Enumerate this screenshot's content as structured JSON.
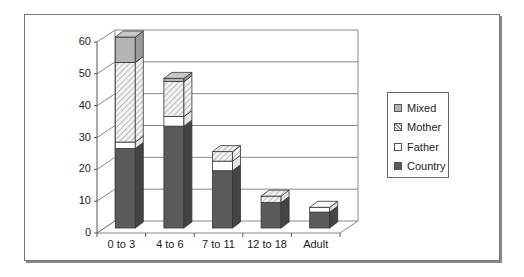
{
  "chart_data": {
    "type": "bar",
    "stacked": true,
    "three_d": true,
    "title": "",
    "xlabel": "",
    "ylabel": "",
    "ylim": [
      0,
      60
    ],
    "yticks": [
      "0",
      "10",
      "20",
      "30",
      "40",
      "50",
      "60"
    ],
    "grid": true,
    "legend_position": "right",
    "categories": [
      "0 to 3",
      "4 to 6",
      "7 to 11",
      "12 to 18",
      "Adult"
    ],
    "series": [
      {
        "name": "Country",
        "color": "#5a5a5a",
        "pattern": "solid",
        "values": [
          25,
          32,
          18,
          8,
          5
        ]
      },
      {
        "name": "Father",
        "color": "#ffffff",
        "pattern": "solid",
        "values": [
          2,
          3,
          3,
          0,
          1.5
        ]
      },
      {
        "name": "Mother",
        "color": "#e8e8e8",
        "pattern": "hatch",
        "values": [
          25,
          11,
          3,
          2,
          0
        ]
      },
      {
        "name": "Mixed",
        "color": "#b4b4b4",
        "pattern": "solid",
        "values": [
          8,
          1,
          0,
          0,
          0
        ]
      }
    ]
  },
  "legend": {
    "items": [
      {
        "label": "Mixed"
      },
      {
        "label": "Mother"
      },
      {
        "label": "Father"
      },
      {
        "label": "Country"
      }
    ]
  }
}
